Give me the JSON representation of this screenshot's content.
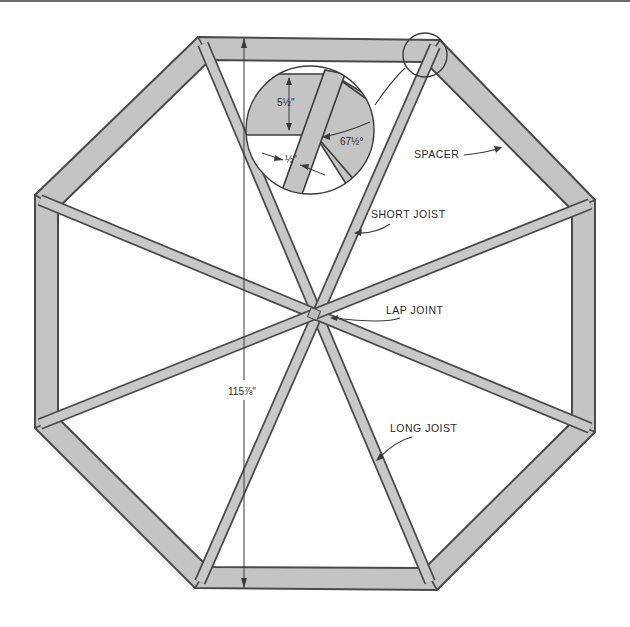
{
  "diagram": {
    "type": "octagonal deck frame plan",
    "colors": {
      "lumber_fill": "#c4c4c4",
      "outline": "#4a4a4a",
      "background": "#ffffff"
    },
    "labels": {
      "spacer": "SPACER",
      "short_joist": "SHORT JOIST",
      "lap_joint": "LAP JOINT",
      "long_joist": "LONG JOIST"
    },
    "dimensions": {
      "overall_span": "115⅞\"",
      "detail_board_width": "5½\"",
      "detail_joist_gap": "½\"",
      "detail_angle": "67½°"
    },
    "detail_callout": {
      "description": "enlarged corner joint detail",
      "source_corner": "top-right"
    }
  }
}
